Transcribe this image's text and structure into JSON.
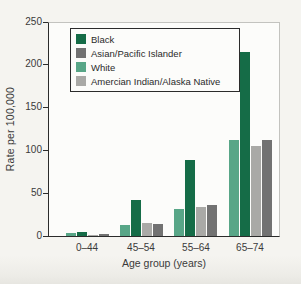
{
  "figure": {
    "background": "#f5f4f0",
    "plot_background": "#fcfcfa",
    "axis_color": "#2b2b2b"
  },
  "chart_data": {
    "type": "bar",
    "title": "",
    "xlabel": "Age group (years)",
    "ylabel": "Rate per 100,000",
    "ylim": [
      0,
      250
    ],
    "yticks": [
      0,
      50,
      100,
      150,
      200,
      250
    ],
    "categories": [
      "0–44",
      "45–54",
      "55–64",
      "65–74"
    ],
    "series": [
      {
        "name": "Black",
        "color": "#156c47",
        "values": [
          5,
          42,
          88,
          215
        ]
      },
      {
        "name": "Asian/Pacific Islander",
        "color": "#727272",
        "values": [
          2,
          14,
          36,
          112
        ]
      },
      {
        "name": "White",
        "color": "#58a687",
        "values": [
          3,
          13,
          32,
          112
        ]
      },
      {
        "name": "Amercian Indian/Alaska Native",
        "color": "#a9a9a6",
        "values": [
          1.5,
          15,
          34,
          105
        ]
      }
    ],
    "bar_order": [
      "White",
      "Black",
      "Amercian Indian/Alaska Native",
      "Asian/Pacific Islander"
    ],
    "legend_position": "top-left-inside",
    "grid": "off"
  }
}
